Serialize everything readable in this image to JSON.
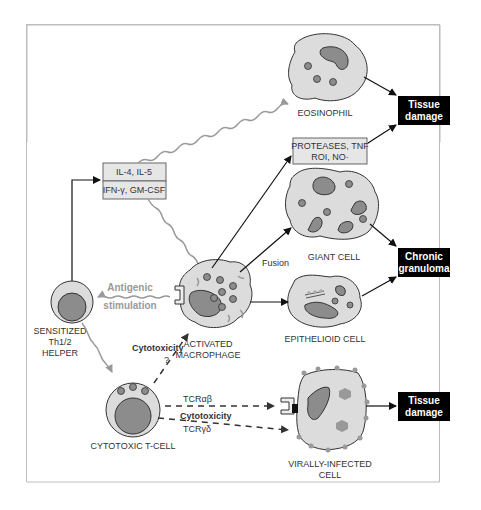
{
  "diagram": {
    "boxes": {
      "cytokines_top": "IL-4, IL-5",
      "cytokines_bottom": "IFN-γ, GM-CSF",
      "mediators_line1": "PROTEASES, TNF",
      "mediators_line2": "ROI, NO·"
    },
    "outcomes": {
      "tissue_damage_1_line1": "Tissue",
      "tissue_damage_1_line2": "damage",
      "chronic_granuloma_line1": "Chronic",
      "chronic_granuloma_line2": "granuloma",
      "tissue_damage_2_line1": "Tissue",
      "tissue_damage_2_line2": "damage"
    },
    "cells": {
      "eosinophil": "EOSINOPHIL",
      "giant_cell": "GIANT CELL",
      "epithelioid_cell": "EPITHELIOID CELL",
      "activated_macrophage_line1": "ACTIVATED",
      "activated_macrophage_line2": "MACROPHAGE",
      "sensitized_line1": "SENSITIZED",
      "sensitized_line2": "Th1/2",
      "sensitized_line3": "HELPER",
      "cytotoxic_t_cell": "CYTOTOXIC T-CELL",
      "virally_infected_line1": "VIRALLY-INFECTED",
      "virally_infected_line2": "CELL"
    },
    "edge_labels": {
      "fusion": "Fusion",
      "antigenic_line1": "Antigenic",
      "antigenic_line2": "stimulation",
      "cytotoxicity_macrophage": "Cytotoxicity",
      "question_mark": "?",
      "tcr_ab": "TCRαβ",
      "cytotoxicity_virus": "Cytotoxicity",
      "tcr_gd": "TCRγδ"
    },
    "colors": {
      "cell_fill": "#dcdcdc",
      "nucleus_fill": "#8c8c8c",
      "box_fill": "#e6e6e6",
      "outcome_fill": "#000000",
      "wavy_signal": "#9a9a9a"
    }
  }
}
